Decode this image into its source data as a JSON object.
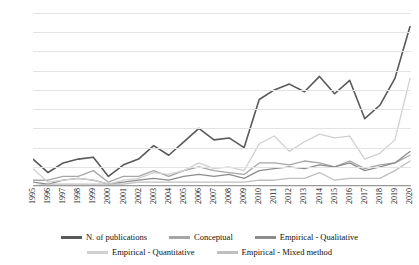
{
  "chart_data": {
    "type": "line",
    "title": "",
    "xlabel": "",
    "ylabel": "",
    "ylim": [
      0,
      90
    ],
    "ytick_step": 10,
    "grid": true,
    "legend_position": "bottom",
    "categories": [
      "1995",
      "1996",
      "1997",
      "1998",
      "1999",
      "2000",
      "2001",
      "2002",
      "2003",
      "2004",
      "2005",
      "2006",
      "2007",
      "2008",
      "2009",
      "2010",
      "2011",
      "2012",
      "2013",
      "2014",
      "2015",
      "2016",
      "2017",
      "2018",
      "2019",
      "2020"
    ],
    "yticks": [
      "0",
      "10",
      "20",
      "30",
      "40",
      "50",
      "60",
      "70",
      "80",
      "90"
    ],
    "series": [
      {
        "name": "N. of publications",
        "color": "#595959",
        "values": [
          14,
          7,
          12,
          14,
          15,
          5,
          11,
          14,
          21,
          16,
          23,
          30,
          24,
          25,
          20,
          45,
          50,
          53,
          49,
          57,
          48,
          55,
          35,
          42,
          56,
          83
        ]
      },
      {
        "name": "Conceptual",
        "color": "#a6a6a6",
        "values": [
          3,
          3,
          5,
          5,
          8,
          2,
          5,
          5,
          8,
          5,
          8,
          10,
          8,
          7,
          6,
          12,
          12,
          11,
          13,
          12,
          10,
          13,
          9,
          11,
          12,
          16
        ]
      },
      {
        "name": "Empirical - Qualitative",
        "color": "#8c8c8c",
        "values": [
          2,
          1,
          3,
          4,
          3,
          1,
          2,
          3,
          4,
          3,
          5,
          6,
          5,
          6,
          4,
          8,
          9,
          10,
          9,
          11,
          10,
          12,
          8,
          10,
          12,
          18
        ]
      },
      {
        "name": "Empirical - Quantitative",
        "color": "#d0d0d0",
        "values": [
          9,
          2,
          3,
          4,
          3,
          1,
          3,
          4,
          7,
          6,
          8,
          12,
          9,
          10,
          8,
          22,
          26,
          18,
          23,
          27,
          25,
          26,
          14,
          17,
          24,
          56
        ]
      },
      {
        "name": "Empirical - Mixed method",
        "color": "#bfbfbf",
        "values": [
          0,
          1,
          1,
          1,
          1,
          1,
          1,
          2,
          2,
          2,
          2,
          2,
          2,
          2,
          2,
          3,
          3,
          4,
          4,
          7,
          3,
          4,
          4,
          4,
          8,
          13
        ]
      }
    ]
  }
}
